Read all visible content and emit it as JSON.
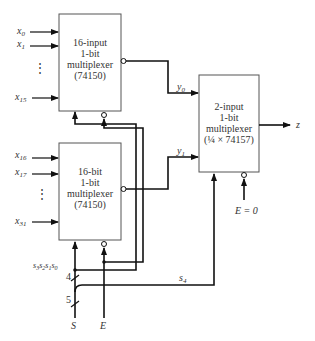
{
  "diagram": {
    "mux_a": {
      "lines": [
        "16-input",
        "1-bit",
        "multiplexer",
        "(74150)"
      ],
      "inputs": [
        "x0",
        "x1",
        "x15"
      ],
      "input_labels": [
        {
          "base": "x",
          "sub": "0"
        },
        {
          "base": "x",
          "sub": "1"
        },
        {
          "base": "x",
          "sub": "15"
        }
      ],
      "ellipsis": "⋮",
      "output": "y0"
    },
    "mux_b": {
      "lines": [
        "16-bit",
        "1-bit",
        "multiplexer",
        "(74150)"
      ],
      "inputs": [
        "x16",
        "x17",
        "x31"
      ],
      "input_labels": [
        {
          "base": "x",
          "sub": "16"
        },
        {
          "base": "x",
          "sub": "17"
        },
        {
          "base": "x",
          "sub": "31"
        }
      ],
      "ellipsis": "⋮",
      "output": "y1"
    },
    "mux_c": {
      "lines": [
        "2-input",
        "1-bit",
        "multiplexer",
        "(¼ × 74157)"
      ],
      "inputs": [
        "y0",
        "y1"
      ],
      "output": "z",
      "enable": "E = 0"
    },
    "signals": {
      "y0": {
        "base": "y",
        "sub": "0"
      },
      "y1": {
        "base": "y",
        "sub": "1"
      },
      "z": "z",
      "s4": {
        "base": "s",
        "sub": "4"
      },
      "select_bus": "s3s2s1s0",
      "select_bus_parts": [
        {
          "base": "s",
          "sub": "3"
        },
        {
          "base": "s",
          "sub": "2"
        },
        {
          "base": "s",
          "sub": "1"
        },
        {
          "base": "s",
          "sub": "0"
        }
      ],
      "bus_width_4": "4",
      "bus_width_5": "5",
      "S": "S",
      "E": "E",
      "E0": "E = 0"
    }
  }
}
